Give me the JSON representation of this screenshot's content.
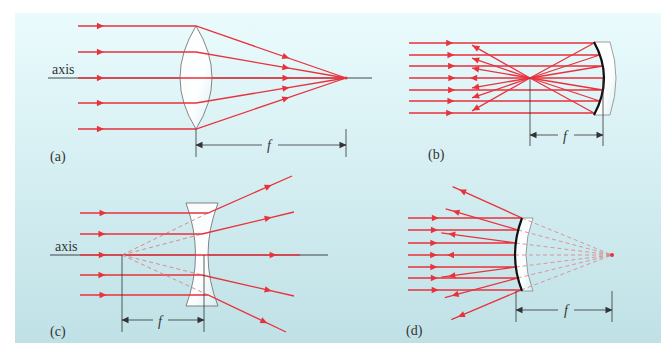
{
  "figure": {
    "colors": {
      "background_top": "#eafbfd",
      "background_bottom": "#bfe1e6",
      "ray": "#e8323c",
      "virtual_ray": "#d98b8e",
      "axis": "#333333",
      "mirror": "#111111",
      "lens_fill": "#ffffff",
      "lens_edge": "#777777"
    },
    "panels": [
      {
        "id": "a",
        "label": "(a)",
        "element": "converging lens",
        "axis_label": "axis",
        "focal_label": "f",
        "behavior": "parallel rays converge at real focal point"
      },
      {
        "id": "b",
        "label": "(b)",
        "element": "concave mirror",
        "focal_label": "f",
        "behavior": "parallel rays reflect through real focal point"
      },
      {
        "id": "c",
        "label": "(c)",
        "element": "diverging lens",
        "axis_label": "axis",
        "focal_label": "f",
        "behavior": "parallel rays diverge from virtual focal point"
      },
      {
        "id": "d",
        "label": "(d)",
        "element": "convex mirror",
        "focal_label": "f",
        "behavior": "parallel rays reflect as if from virtual focal point behind mirror"
      }
    ]
  }
}
